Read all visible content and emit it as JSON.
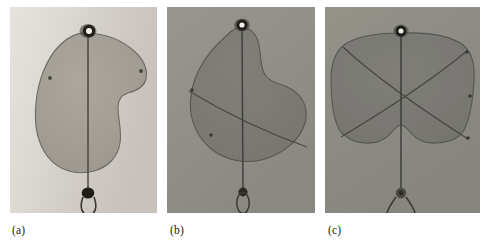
{
  "figure": {
    "type": "photographic-figure",
    "panel_count": 3,
    "background_color": "#ffffff",
    "panels": [
      {
        "id": "a",
        "caption": "(a)",
        "subject": "deployed membrane sail with single suspension line",
        "background_color": "#cecac4",
        "background_color_light": "#e2dfd9",
        "membrane_color": "#a3a099",
        "membrane_edge_color": "#6e6b65",
        "line_color": "#4a4742",
        "top_fitting": "ring-with-white-center",
        "bottom_fitting": "dark-knot-with-loop",
        "marker_count": 2,
        "internal_seam_count": 0
      },
      {
        "id": "b",
        "caption": "(b)",
        "subject": "deployed membrane sail with diagonal seam",
        "background_color": "#8f8e8a",
        "background_color_light": "#9a9995",
        "membrane_color": "#7b7a76",
        "membrane_edge_color": "#5a5955",
        "line_color": "#3d3c39",
        "top_fitting": "ring-with-white-center",
        "bottom_fitting": "dark-knot-with-loop",
        "marker_count": 2,
        "internal_seam_count": 1
      },
      {
        "id": "c",
        "caption": "(c)",
        "subject": "deployed membrane sail with crossed seams",
        "background_color": "#8b8a86",
        "background_color_light": "#97968f",
        "membrane_color": "#797874",
        "membrane_edge_color": "#575652",
        "line_color": "#3a3936",
        "top_fitting": "ring-with-white-center",
        "bottom_fitting": "dark-knot-with-loop",
        "marker_count": 3,
        "internal_seam_count": 2
      }
    ]
  }
}
